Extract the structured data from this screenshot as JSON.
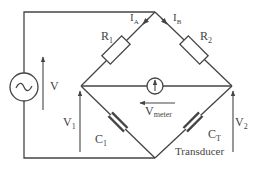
{
  "diagram": {
    "type": "bridge-circuit",
    "colors": {
      "wire": "#444444",
      "background": "#ffffff"
    },
    "source": {
      "icon": "ac-source-icon",
      "voltage_label": "V"
    },
    "resistors": [
      {
        "label": "R",
        "sub": "1"
      },
      {
        "label": "R",
        "sub": "2"
      }
    ],
    "currents": [
      {
        "label": "I",
        "sub": "A"
      },
      {
        "label": "I",
        "sub": "B"
      }
    ],
    "meter": {
      "icon": "meter-icon",
      "label": "V",
      "sub": "meter"
    },
    "capacitors": [
      {
        "label": "C",
        "sub": "1"
      },
      {
        "label": "C",
        "sub": "T"
      }
    ],
    "voltages": [
      {
        "label": "V",
        "sub": "1"
      },
      {
        "label": "V",
        "sub": "2"
      }
    ],
    "transducer_label": "Transducer"
  }
}
